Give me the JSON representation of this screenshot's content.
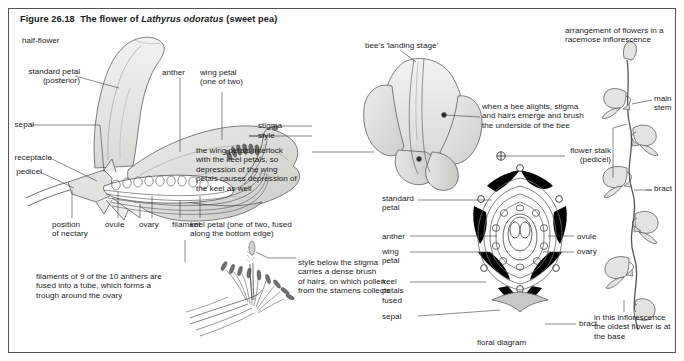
{
  "figure": {
    "number": "Figure 26.18",
    "title_lead": "The flower of ",
    "species": "Lathyrus odoratus",
    "title_tail": " (sweet pea)"
  },
  "panels": {
    "half_flower": {
      "caption": "half-flower",
      "labels": {
        "standard_petal": "standard petal\n(posterior)",
        "sepal": "sepal",
        "receptacle": "receptacle",
        "pedicel": "pedicel",
        "position_of_nectary": "position\nof nectary",
        "ovule": "ovule",
        "ovary": "ovary",
        "filament": "filament",
        "anther": "anther",
        "wing_petal": "wing petal\n(one of two)",
        "stigma": "stigma",
        "style": "style",
        "keel_petal": "keel petal (one of two, fused\nalong the bottom edge)",
        "wing_note": "the wing petals interlock\nwith the keel petals, so\ndepression of the wing\npetals causes depression of\nthe keel as well"
      }
    },
    "stamens": {
      "note_fused": "filaments of 9 of the 10 anthers are\nfused into a tube, which forms a\ntrough around the ovary",
      "note_style": "style below the stigma\ncarries a dense brush\nof hairs, on which pollen\nfrom the stamens collects"
    },
    "bee_view": {
      "landing_stage": "bee's 'landing stage'",
      "bee_note": "when a bee alights, stigma\nand hairs emerge and brush\nthe underside of the bee"
    },
    "floral_diagram": {
      "caption": "floral diagram",
      "axis_symbol": "⊕",
      "labels": {
        "standard_petal": "standard\npetal",
        "anther": "anther",
        "wing_petal": "wing\npetal",
        "keel_petals": "keel\npetals\nfused",
        "sepal": "sepal",
        "ovule": "ovule",
        "ovary": "ovary",
        "bract": "bract"
      }
    },
    "inflorescence": {
      "title": "arrangement of flowers in a\nracemose inflorescence",
      "labels": {
        "main_stem": "main\nstem",
        "flower_stalk": "flower stalk\n(pedicel)",
        "bract": "bract"
      },
      "note": "in this inflorescence\nthe oldest flower is at\nthe base"
    }
  },
  "colors": {
    "ink": "#1d1d1d",
    "line": "#4a4a4a",
    "fill_light": "#e9e9e7",
    "fill_mid": "#d7d7d4",
    "fill_dark": "#bdbdb9",
    "black": "#000000",
    "frame": "#555555"
  }
}
